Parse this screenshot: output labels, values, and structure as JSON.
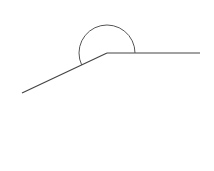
{
  "diagram": {
    "type": "angle",
    "stroke_color": "#444444",
    "background": "#ffffff",
    "vertex": {
      "x": 107,
      "y": 53
    },
    "ray_left_end": {
      "x": 22,
      "y": 93
    },
    "ray_right_end": {
      "x": 200,
      "y": 53
    },
    "arc": {
      "radius": 28,
      "description": "angle arc drawn above the vertex from right ray counter-clockwise to left ray"
    }
  }
}
